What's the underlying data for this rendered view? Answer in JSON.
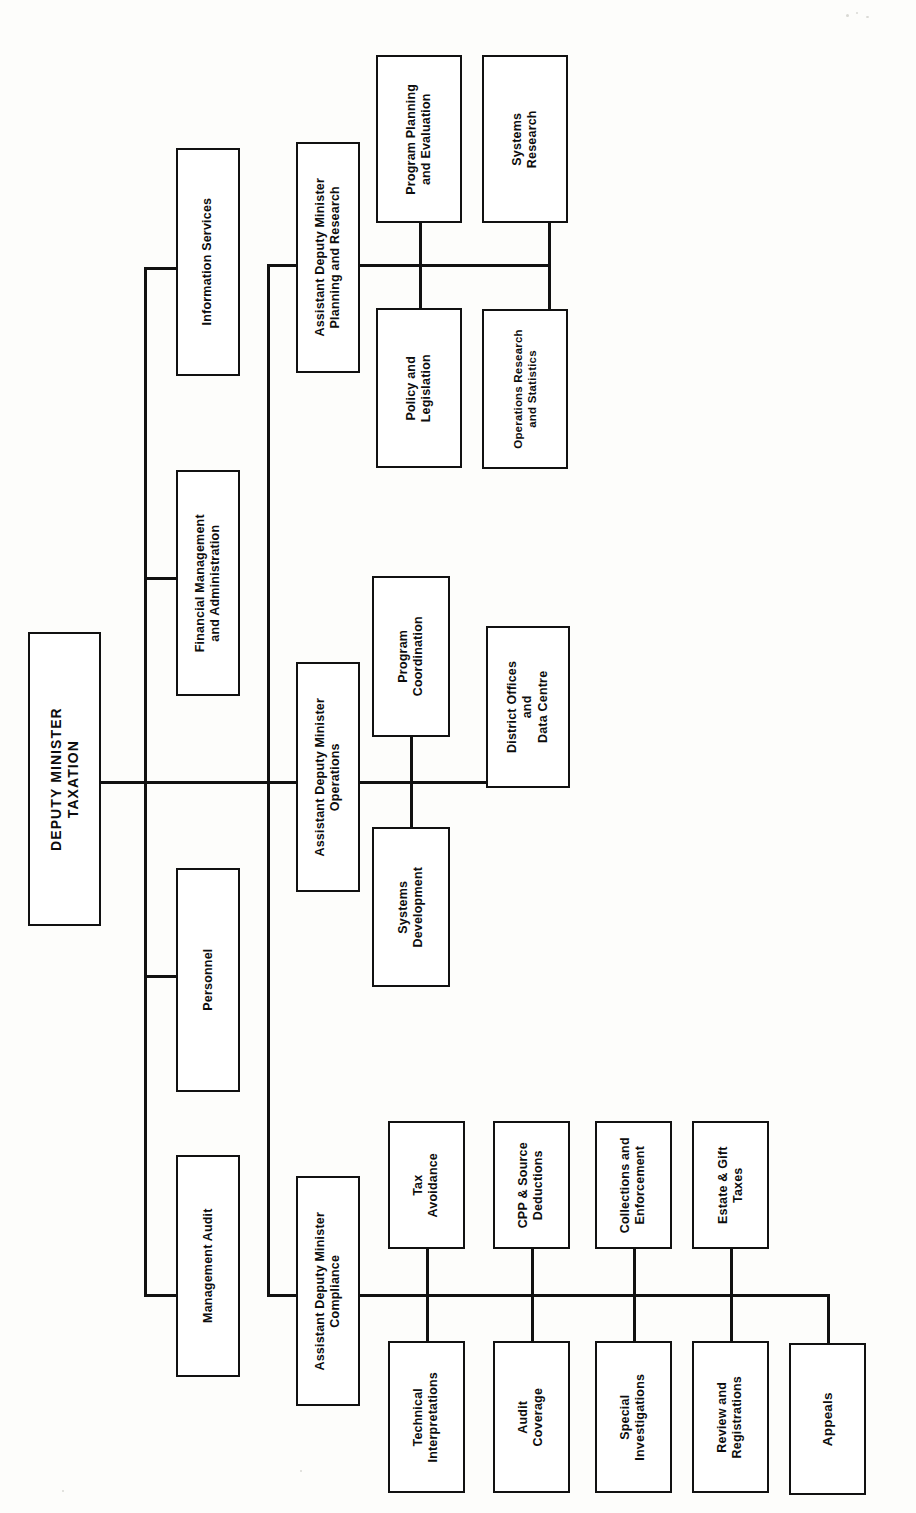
{
  "document": {
    "kind": "organization-chart",
    "orientation": "rotated-90-counterclockwise",
    "root": "DEPUTY MINISTER\nTAXATION"
  },
  "nodes": {
    "deputy_minister": "DEPUTY MINISTER\nTAXATION",
    "management_audit": "Management Audit",
    "personnel": "Personnel",
    "financial_management": "Financial Management\nand Administration",
    "information_services": "Information Services",
    "adm_compliance": "Assistant Deputy Minister\nCompliance",
    "adm_operations": "Assistant Deputy Minister\nOperations",
    "adm_planning": "Assistant Deputy Minister\nPlanning and Research",
    "technical_interpretations": "Technical\nInterpretations",
    "tax_avoidance": "Tax\nAvoidance",
    "audit_coverage": "Audit\nCoverage",
    "cpp_source_deductions": "CPP & Source\nDeductions",
    "special_investigations": "Special\nInvestigations",
    "collections_enforcement": "Collections and\nEnforcement",
    "review_registrations": "Review and\nRegistrations",
    "estate_gift_taxes": "Estate & Gift\nTaxes",
    "appeals": "Appeals",
    "systems_development": "Systems\nDevelopment",
    "program_coordination": "Program\nCoordination",
    "district_offices": "District Offices\nand\nData Centre",
    "policy_legislation": "Policy and\nLegislation",
    "program_planning_evaluation": "Program Planning\nand Evaluation",
    "operations_research": "Operations Research\nand Statistics",
    "systems_research": "Systems\nResearch"
  },
  "colors": {
    "ink": "#111111",
    "paper": "#fdfdfb"
  }
}
